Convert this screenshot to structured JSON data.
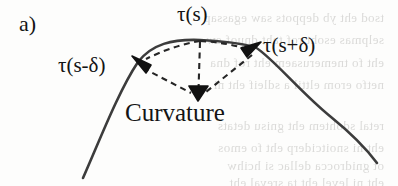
{
  "figure": {
    "panel_label": "a)",
    "caption_text": "Curvature",
    "labels": {
      "tangent_at_s": "τ(s)",
      "tangent_at_s_plus_delta": "τ(s+δ)",
      "tangent_at_s_minus_delta": "τ(s-δ)",
      "curvature": "Curvature"
    },
    "colors": {
      "curve": "#3c3c3c",
      "dashed": "#2a2a2a",
      "arrowhead": "#111111",
      "text": "#141414",
      "background": "#fdfdfc",
      "bleed_text": "#8d8c88"
    }
  },
  "chart_data": {
    "type": "line",
    "title": "",
    "xlabel": "",
    "ylabel": "",
    "grid": false,
    "legend": "none",
    "curve_points": [
      [
        83,
        178
      ],
      [
        110,
        120
      ],
      [
        138,
        62
      ],
      [
        160,
        48
      ],
      [
        180,
        41
      ],
      [
        200,
        40
      ],
      [
        222,
        42
      ],
      [
        242,
        45
      ],
      [
        255,
        47
      ],
      [
        280,
        63
      ],
      [
        330,
        115
      ],
      [
        377,
        163
      ]
    ],
    "markers": [
      {
        "name": "tangent-point-s-minus-delta",
        "x": 138,
        "y": 62,
        "arrow_angle_deg": 205
      },
      {
        "name": "apex-point-s",
        "x": 200,
        "y": 40,
        "arrow_angle_deg": 0
      },
      {
        "name": "tangent-point-s-plus-delta",
        "x": 255,
        "y": 47,
        "arrow_angle_deg": 40
      },
      {
        "name": "curvature-vector-tip",
        "x": 198,
        "y": 97,
        "arrow_angle_deg": 90
      }
    ],
    "dashed_segments": [
      {
        "name": "chord-apex-to-left-tangent",
        "from": [
          200,
          41
        ],
        "to": [
          143,
          60
        ]
      },
      {
        "name": "chord-apex-to-right-tangent",
        "from": [
          200,
          41
        ],
        "to": [
          250,
          50
        ]
      },
      {
        "name": "vertical-apex-to-curvature",
        "from": [
          200,
          41
        ],
        "to": [
          198,
          92
        ]
      },
      {
        "name": "left-tangent-to-curvature",
        "from": [
          142,
          67
        ],
        "to": [
          192,
          93
        ]
      },
      {
        "name": "right-tangent-to-curvature",
        "from": [
          252,
          54
        ],
        "to": [
          205,
          92
        ]
      }
    ],
    "axis_ranges": {
      "x": [
        0,
        398
      ],
      "y": [
        0,
        186
      ]
    }
  },
  "bleed_through_rows": [
    {
      "top": 10,
      "text": "tsod eht yb deppots saw egassap"
    },
    {
      "top": 32,
      "text": "selpmas esoht rof taht dnuof ew"
    },
    {
      "top": 55,
      "text": "eht fo tnemerusaem eht rof dna"
    },
    {
      "top": 77,
      "text": "netfo erom elttil a sdleif eht ni"
    },
    {
      "top": 118,
      "text": "retal sdohtem eht gnisu detats"
    },
    {
      "top": 140,
      "text": "eht ni snoitciderp eht fo emos"
    },
    {
      "top": 158,
      "text": "ot gnidrocca dellac si hcihw"
    },
    {
      "top": 175,
      "text": "eht ni level eht ta sreyal eht"
    }
  ]
}
